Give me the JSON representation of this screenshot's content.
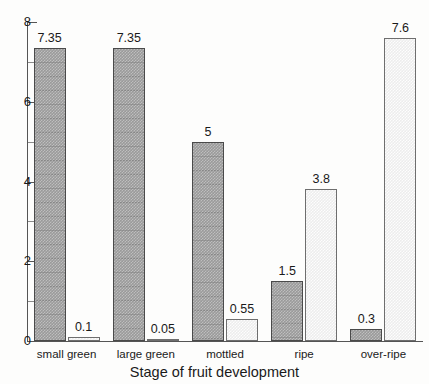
{
  "chart_data": {
    "type": "bar",
    "title": "",
    "xlabel": "Stage of fruit development",
    "ylabel": "",
    "categories": [
      "small green",
      "large green",
      "mottled",
      "ripe",
      "over-ripe"
    ],
    "series": [
      {
        "name": "dark",
        "values": [
          7.35,
          7.35,
          5,
          1.5,
          0.3
        ],
        "labels": [
          "7.35",
          "7.35",
          "5",
          "1.5",
          "0.3"
        ]
      },
      {
        "name": "light",
        "values": [
          0.1,
          0.05,
          0.55,
          3.8,
          7.6
        ],
        "labels": [
          "0.1",
          "0.05",
          "0.55",
          "3.8",
          "7.6"
        ]
      }
    ],
    "ylim": [
      0,
      8
    ],
    "y_major_ticks": [
      0,
      2,
      4,
      6,
      8
    ],
    "y_minor_ticks": [
      1,
      3,
      5,
      7
    ],
    "y_tick_labels": [
      "0",
      "2",
      "4",
      "6",
      "8"
    ],
    "grid": false,
    "legend": "none"
  },
  "axis": {
    "y_labels": [
      "8",
      "6",
      "4",
      "2",
      "0"
    ]
  },
  "xtitle": {
    "text": "Stage of fruit development"
  }
}
